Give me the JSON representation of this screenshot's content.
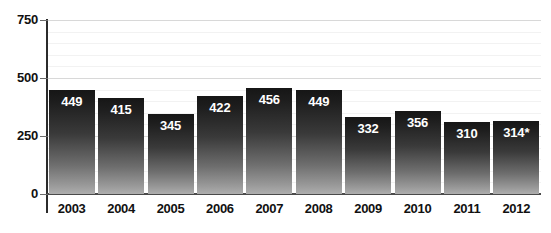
{
  "chart_data": {
    "type": "bar",
    "title": "",
    "xlabel": "",
    "ylabel": "",
    "categories": [
      "2003",
      "2004",
      "2005",
      "2006",
      "2007",
      "2008",
      "2009",
      "2010",
      "2011",
      "2012"
    ],
    "values": [
      449,
      415,
      345,
      422,
      456,
      449,
      332,
      356,
      310,
      314
    ],
    "value_labels": [
      "449",
      "415",
      "345",
      "422",
      "456",
      "449",
      "332",
      "356",
      "310",
      "314*"
    ],
    "ylim": [
      0,
      750
    ],
    "y_ticks": [
      0,
      250,
      500,
      750
    ],
    "y_tick_labels": [
      "0",
      "250",
      "500",
      "750"
    ],
    "minor_gridline_step": 50,
    "grid": true,
    "legend": "none",
    "annotations": [
      "* denotes provisional/estimated value on 2012"
    ],
    "colors": {
      "background": "#ffffff",
      "bar_top": "#161616",
      "bar_bottom": "#aeaeae",
      "axis": "#2b2b2b",
      "baseline": "#4a4a4a",
      "gridline_major": "#d8d8d8",
      "gridline_minor": "#f2f2f2",
      "value_text": "#ffffff",
      "tick_text": "#111111"
    }
  },
  "axis": {
    "y_axis_name": "value-axis",
    "x_axis_name": "year-axis"
  }
}
